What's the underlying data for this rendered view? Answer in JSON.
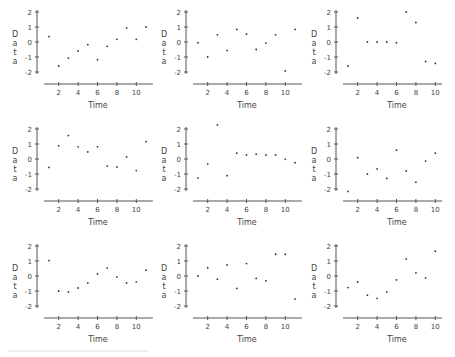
{
  "figure": {
    "layout": {
      "rows": 3,
      "cols": 3
    },
    "colors": {
      "axis": "#555555",
      "points": "#333333",
      "text": "#444444",
      "background": "#ffffff"
    }
  },
  "chart_data": [
    {
      "type": "scatter",
      "title": "",
      "xlabel": "Time",
      "ylabel": "Data",
      "xticks": [
        2,
        4,
        6,
        8,
        10
      ],
      "yticks": [
        2,
        1,
        0,
        -1,
        -2
      ],
      "ytick_labels": [
        "2",
        "1",
        "0",
        "-1",
        "-2"
      ],
      "xlim": [
        0.5,
        11.5
      ],
      "ylim": [
        -2,
        2
      ],
      "grid": false,
      "x": [
        1,
        2,
        3,
        4,
        5,
        6,
        7,
        8,
        9,
        10,
        11
      ],
      "y": [
        0.36,
        -1.6,
        -1.07,
        -0.6,
        -0.18,
        -1.18,
        -0.29,
        0.18,
        0.93,
        0.18,
        1.0
      ]
    },
    {
      "type": "scatter",
      "title": "",
      "xlabel": "Time",
      "ylabel": "Data",
      "xticks": [
        2,
        4,
        6,
        8,
        10
      ],
      "yticks": [
        2,
        1,
        0,
        -1,
        -2
      ],
      "ytick_labels": [
        "2",
        "1",
        "0",
        "-1",
        "-2"
      ],
      "xlim": [
        0.5,
        11.5
      ],
      "ylim": [
        -2,
        2
      ],
      "grid": false,
      "x": [
        1,
        2,
        3,
        4,
        5,
        6,
        7,
        8,
        9,
        10,
        11
      ],
      "y": [
        -0.05,
        -1.0,
        0.48,
        -0.57,
        0.84,
        0.52,
        -0.5,
        -0.07,
        0.48,
        -1.93,
        0.84
      ]
    },
    {
      "type": "scatter",
      "title": "",
      "xlabel": "Time",
      "ylabel": "Data",
      "xticks": [
        2,
        4,
        6,
        8,
        10
      ],
      "yticks": [
        2,
        1,
        0,
        -1,
        -2
      ],
      "ytick_labels": [
        "2",
        "1",
        "0",
        "-1",
        "-2"
      ],
      "xlim": [
        0.5,
        10.5
      ],
      "ylim": [
        -2,
        2
      ],
      "grid": false,
      "x": [
        1,
        2,
        3,
        4,
        5,
        6,
        7,
        8,
        9,
        10
      ],
      "y": [
        -1.6,
        1.6,
        0.0,
        0.0,
        0.0,
        -0.05,
        2.0,
        1.3,
        -1.3,
        -1.43
      ]
    },
    {
      "type": "scatter",
      "title": "",
      "xlabel": "Time",
      "ylabel": "Data",
      "xticks": [
        2,
        4,
        6,
        8,
        10
      ],
      "yticks": [
        2,
        1,
        0,
        -1,
        -2
      ],
      "ytick_labels": [
        "2",
        "1",
        "0",
        "-1",
        "-2"
      ],
      "xlim": [
        0.5,
        11.5
      ],
      "ylim": [
        -2,
        2
      ],
      "grid": false,
      "x": [
        1,
        2,
        3,
        4,
        5,
        6,
        7,
        8,
        9,
        10,
        11
      ],
      "y": [
        -0.56,
        0.88,
        1.56,
        0.81,
        0.47,
        0.81,
        -0.47,
        -0.53,
        0.14,
        -0.77,
        1.16
      ]
    },
    {
      "type": "scatter",
      "title": "",
      "xlabel": "Time",
      "ylabel": "Data",
      "xticks": [
        2,
        4,
        6,
        8,
        10
      ],
      "yticks": [
        2,
        1,
        0,
        -1,
        -2
      ],
      "ytick_labels": [
        "2",
        "1",
        "0",
        "-1",
        "-2"
      ],
      "xlim": [
        0.5,
        11.5
      ],
      "ylim": [
        -2,
        2
      ],
      "grid": false,
      "x": [
        1,
        2,
        3,
        4,
        5,
        6,
        7,
        8,
        9,
        10,
        11
      ],
      "y": [
        -1.27,
        -0.34,
        2.27,
        -1.11,
        0.39,
        0.27,
        0.32,
        0.27,
        0.27,
        -0.02,
        -0.25
      ]
    },
    {
      "type": "scatter",
      "title": "",
      "xlabel": "Time",
      "ylabel": "Data",
      "xticks": [
        2,
        4,
        6,
        8,
        10
      ],
      "yticks": [
        2,
        1,
        0,
        -1,
        -2
      ],
      "ytick_labels": [
        "2",
        "1",
        "0",
        "-1",
        "-2"
      ],
      "xlim": [
        0.5,
        10.5
      ],
      "ylim": [
        -2,
        2
      ],
      "grid": false,
      "x": [
        1,
        2,
        3,
        4,
        5,
        6,
        7,
        8,
        9,
        10
      ],
      "y": [
        -2.16,
        0.09,
        -1.0,
        -0.66,
        -1.3,
        0.59,
        -0.8,
        -1.55,
        -0.14,
        0.39
      ]
    },
    {
      "type": "scatter",
      "title": "",
      "xlabel": "Time",
      "ylabel": "Data",
      "xticks": [
        2,
        4,
        6,
        8,
        10
      ],
      "yticks": [
        2,
        1,
        0,
        -1,
        -2
      ],
      "ytick_labels": [
        "2",
        "1",
        "0",
        "-1",
        "-2"
      ],
      "xlim": [
        0.5,
        11.5
      ],
      "ylim": [
        -2,
        2
      ],
      "grid": false,
      "x": [
        1,
        2,
        3,
        4,
        5,
        6,
        7,
        8,
        9,
        10,
        11
      ],
      "y": [
        1.03,
        -1.0,
        -1.06,
        -0.8,
        -0.46,
        0.14,
        0.53,
        -0.07,
        -0.46,
        -0.39,
        0.39
      ]
    },
    {
      "type": "scatter",
      "title": "",
      "xlabel": "Time",
      "ylabel": "Data",
      "xticks": [
        2,
        4,
        6,
        8,
        10
      ],
      "yticks": [
        2,
        1,
        0,
        -1,
        -2
      ],
      "ytick_labels": [
        "2",
        "1",
        "0",
        "-1",
        "-2"
      ],
      "xlim": [
        0.5,
        11.5
      ],
      "ylim": [
        -2,
        2
      ],
      "grid": false,
      "x": [
        1,
        2,
        3,
        4,
        5,
        6,
        7,
        8,
        9,
        10,
        11
      ],
      "y": [
        0.0,
        0.55,
        -0.21,
        0.74,
        -0.83,
        0.83,
        -0.16,
        -0.32,
        1.45,
        1.45,
        -1.54
      ]
    },
    {
      "type": "scatter",
      "title": "",
      "xlabel": "Time",
      "ylabel": "Data",
      "xticks": [
        2,
        4,
        6,
        8,
        10
      ],
      "yticks": [
        2,
        1,
        0,
        -1,
        -2
      ],
      "ytick_labels": [
        "2",
        "1",
        "0",
        "-1",
        "-2"
      ],
      "xlim": [
        0.5,
        10.5
      ],
      "ylim": [
        -2,
        2
      ],
      "grid": false,
      "x": [
        1,
        2,
        3,
        4,
        5,
        6,
        7,
        8,
        9,
        10
      ],
      "y": [
        -0.77,
        -0.4,
        -1.28,
        -1.49,
        -1.07,
        -0.26,
        1.14,
        0.21,
        -0.12,
        1.65
      ]
    }
  ]
}
